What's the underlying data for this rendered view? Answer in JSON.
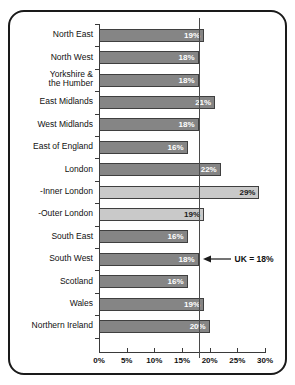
{
  "chart_data": {
    "type": "bar",
    "orientation": "horizontal",
    "title": "",
    "xlabel": "",
    "ylabel": "",
    "xlim": [
      0,
      30
    ],
    "xticks": [
      "0%",
      "5%",
      "10%",
      "15%",
      "20%",
      "25%",
      "30%"
    ],
    "xtick_values": [
      0,
      5,
      10,
      15,
      20,
      25,
      30
    ],
    "grid": false,
    "legend": null,
    "categories": [
      "North East",
      "North West",
      "Yorkshire &\nthe Humber",
      "East Midlands",
      "West Midlands",
      "East of England",
      "London",
      "-Inner London",
      "-Outer London",
      "South East",
      "South West",
      "Scotland",
      "Wales",
      "Northern Ireland"
    ],
    "values": [
      19,
      18,
      18,
      21,
      18,
      16,
      22,
      29,
      19,
      16,
      18,
      16,
      19,
      20
    ],
    "value_labels": [
      "19%",
      "18%",
      "18%",
      "21%",
      "18%",
      "16%",
      "22%",
      "29%",
      "19%",
      "16%",
      "18%",
      "16%",
      "19%",
      "20%"
    ],
    "bar_styles": [
      "dark",
      "dark",
      "dark",
      "dark",
      "dark",
      "dark",
      "dark",
      "light",
      "light",
      "dark",
      "dark",
      "dark",
      "dark",
      "dark"
    ],
    "reference_line": {
      "value": 18,
      "label": "UK = 18%"
    },
    "colors": {
      "bar_dark": "#858585",
      "bar_light": "#c9c9c9",
      "bar_border": "#3f3f3f",
      "axis": "#3a3a3a",
      "reference_line": "#4a4a4a",
      "text": "#111111",
      "label_on_dark": "#ffffff",
      "label_on_light": "#1a1a1a",
      "frame": "#1a1a1a",
      "background": "#ffffff"
    }
  }
}
